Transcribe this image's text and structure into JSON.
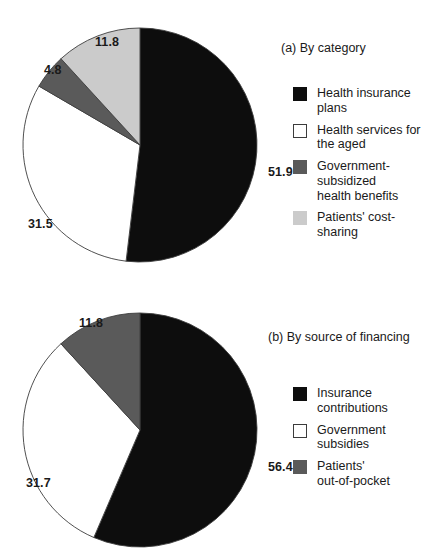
{
  "chart_data": [
    {
      "type": "pie",
      "id": "by-category",
      "title": "(a) By category",
      "caption_position": "top-right",
      "legend_position": "right",
      "grid": false,
      "total": 100.0,
      "units": "percent",
      "start_angle_deg": 0,
      "direction": "clockwise",
      "categories": [
        "Health insurance\nplans",
        "Health services for\nthe aged",
        "Government-\nsubsidized\nhealth benefits",
        "Patients' cost-sharing"
      ],
      "values": [
        51.9,
        31.5,
        4.8,
        11.8
      ],
      "value_labels": [
        "51.9",
        "31.5",
        "4.8",
        "11.8"
      ],
      "colors": [
        "#0d0d0d",
        "#ffffff",
        "#5a5a5a",
        "#cbcbcb"
      ],
      "label_positions": [
        {
          "x": 246,
          "y": 138
        },
        {
          "x": 6,
          "y": 190
        },
        {
          "x": 22,
          "y": 36
        },
        {
          "x": 73,
          "y": 8
        }
      ],
      "xlabel": "",
      "ylabel": ""
    },
    {
      "type": "pie",
      "id": "by-source-of-financing",
      "title": "(b) By source of financing",
      "caption_position": "top-right",
      "legend_position": "right",
      "grid": false,
      "total": 99.9,
      "units": "percent",
      "start_angle_deg": 0,
      "direction": "clockwise",
      "categories": [
        "Insurance\ncontributions",
        "Government subsidies",
        "Patients'\nout-of-pocket"
      ],
      "values": [
        56.4,
        31.7,
        11.8
      ],
      "value_labels": [
        "56.4",
        "31.7",
        "11.8"
      ],
      "colors": [
        "#0d0d0d",
        "#ffffff",
        "#5a5a5a"
      ],
      "label_positions": [
        {
          "x": 246,
          "y": 148
        },
        {
          "x": 4,
          "y": 164
        },
        {
          "x": 57,
          "y": 4
        }
      ],
      "xlabel": "",
      "ylabel": ""
    }
  ],
  "figure": {
    "background": "#ffffff",
    "outline_color": "#3c3c3c",
    "text_color": "#1a1a1a",
    "pie_radius": 117,
    "pie_center": {
      "x": 118,
      "y": 118
    }
  }
}
